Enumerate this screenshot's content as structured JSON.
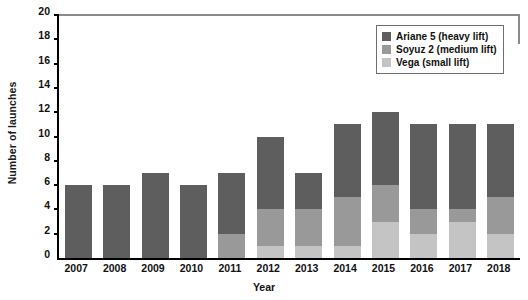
{
  "chart_data": {
    "type": "bar",
    "stacked": true,
    "title": "",
    "xlabel": "Year",
    "ylabel": "Number of launches",
    "categories": [
      "2007",
      "2008",
      "2009",
      "2010",
      "2011",
      "2012",
      "2013",
      "2014",
      "2015",
      "2016",
      "2017",
      "2018"
    ],
    "series": [
      {
        "name": "Vega (small lift)",
        "color": "#c4c4c4",
        "values": [
          0,
          0,
          0,
          0,
          0,
          1,
          1,
          1,
          3,
          2,
          3,
          2
        ]
      },
      {
        "name": "Soyuz 2 (medium lift)",
        "color": "#999999",
        "values": [
          0,
          0,
          0,
          0,
          2,
          3,
          3,
          4,
          3,
          2,
          1,
          3
        ]
      },
      {
        "name": "Ariane 5 (heavy lift)",
        "color": "#5e5e5e",
        "values": [
          6,
          6,
          7,
          6,
          5,
          6,
          3,
          6,
          6,
          7,
          7,
          6
        ]
      }
    ],
    "totals": [
      6,
      6,
      7,
      6,
      7,
      10,
      7,
      11,
      12,
      11,
      11,
      11
    ],
    "ylim": [
      0,
      20
    ],
    "yticks": [
      0,
      2,
      4,
      6,
      8,
      10,
      12,
      14,
      16,
      18,
      20
    ],
    "grid": false,
    "legend_position": "top-right"
  },
  "legend": {
    "items": [
      {
        "label": "Ariane 5 (heavy lift)",
        "color": "#5e5e5e"
      },
      {
        "label": "Soyuz 2 (medium lift)",
        "color": "#999999"
      },
      {
        "label": "Vega (small lift)",
        "color": "#c4c4c4"
      }
    ]
  },
  "axes": {
    "y_title": "Number of launches",
    "x_title": "Year"
  }
}
